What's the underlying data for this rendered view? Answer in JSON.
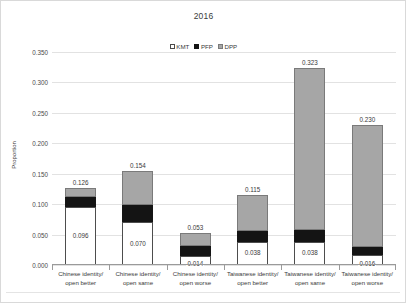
{
  "chart_data": {
    "type": "bar",
    "subtype": "stacked-column",
    "title": "2016",
    "xlabel": "",
    "ylabel": "Proportion",
    "ylim": [
      0.0,
      0.35
    ],
    "ytick_step": 0.05,
    "ytick_labels": [
      "0.350",
      "0.300",
      "0.250",
      "0.200",
      "0.150",
      "0.100",
      "0.050",
      "0.000"
    ],
    "ytick_values": [
      0.35,
      0.3,
      0.25,
      0.2,
      0.15,
      0.1,
      0.05,
      0.0
    ],
    "grid": true,
    "legend_position": "top-center",
    "categories": [
      "Chinese identity/ open better",
      "Chinese identity/ open same",
      "Chinese identity/ open worse",
      "Taiwanese identity/ open better",
      "Taiwanese identity/ open same",
      "Taiwanese identity/ open worse"
    ],
    "category_lines": [
      [
        "Chinese identity/",
        "open better"
      ],
      [
        "Chinese identity/",
        "open same"
      ],
      [
        "Chinese identity/",
        "open worse"
      ],
      [
        "Taiwanese identity/",
        "open better"
      ],
      [
        "Taiwanese identity/",
        "open same"
      ],
      [
        "Taiwanese identity/",
        "open worse"
      ]
    ],
    "series": [
      {
        "name": "KMT",
        "color": "#ffffff",
        "values": [
          0.096,
          0.07,
          0.014,
          0.038,
          0.038,
          0.016
        ]
      },
      {
        "name": "PFP",
        "color": "#141414",
        "values": [
          0.016,
          0.028,
          0.017,
          0.018,
          0.02,
          0.013
        ]
      },
      {
        "name": "DPP",
        "color": "#a6a6a6",
        "values": [
          0.014,
          0.056,
          0.022,
          0.059,
          0.265,
          0.201
        ]
      }
    ],
    "totals": [
      0.126,
      0.154,
      0.053,
      0.115,
      0.323,
      0.23
    ],
    "total_labels": [
      "0.126",
      "0.154",
      "0.053",
      "0.115",
      "0.323",
      "0.230"
    ],
    "base_labels": [
      "0.096",
      "0.070",
      "0.014",
      "0.038",
      "0.038",
      "0.016"
    ],
    "legend_entries": [
      {
        "label": "KMT",
        "color": "#ffffff"
      },
      {
        "label": "PFP",
        "color": "#141414"
      },
      {
        "label": "DPP",
        "color": "#a6a6a6"
      }
    ]
  }
}
